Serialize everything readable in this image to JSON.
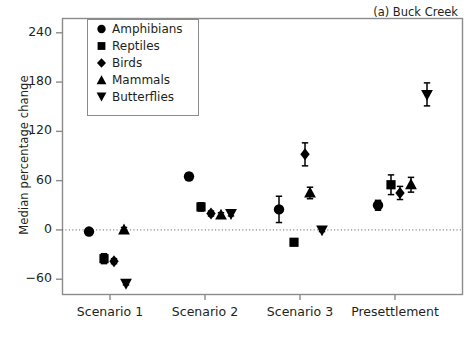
{
  "panel": {
    "title": "(a) Buck Creek"
  },
  "axes": {
    "ylabel": "Median percentage change",
    "xlabel": "",
    "yticks": [
      240,
      180,
      120,
      60,
      0,
      -60
    ],
    "ytick_labels": [
      "240",
      "180",
      "120",
      "60",
      "0",
      "−60"
    ],
    "ylim": [
      -78,
      258
    ],
    "xtick_labels": [
      "Scenario 1",
      "Scenario 2",
      "Scenario 3",
      "Presettlement"
    ],
    "zero_line": 0,
    "grid": false,
    "frame": true
  },
  "legend": {
    "position": "upper-left-inside",
    "entries": [
      {
        "label": "Amphibians",
        "marker": "circle",
        "color": "#000000"
      },
      {
        "label": "Reptiles",
        "marker": "square",
        "color": "#000000"
      },
      {
        "label": "Birds",
        "marker": "diamond",
        "color": "#000000"
      },
      {
        "label": "Mammals",
        "marker": "triangle-up",
        "color": "#000000"
      },
      {
        "label": "Butterflies",
        "marker": "triangle-down",
        "color": "#000000"
      }
    ]
  },
  "chart_data": {
    "type": "scatter",
    "title": "(a) Buck Creek",
    "xlabel": "",
    "ylabel": "Median percentage change",
    "ylim": [
      -78,
      258
    ],
    "categories": [
      "Scenario 1",
      "Scenario 2",
      "Scenario 3",
      "Presettlement"
    ],
    "series": [
      {
        "name": "Amphibians",
        "marker": "circle",
        "values": [
          -2,
          65,
          25,
          30
        ],
        "err_low": [
          3,
          4,
          16,
          6
        ],
        "err_high": [
          3,
          4,
          16,
          6
        ]
      },
      {
        "name": "Reptiles",
        "marker": "square",
        "values": [
          -35,
          28,
          -15,
          55
        ],
        "err_low": [
          6,
          5,
          4,
          12
        ],
        "err_high": [
          6,
          5,
          4,
          12
        ]
      },
      {
        "name": "Birds",
        "marker": "diamond",
        "values": [
          -38,
          20,
          92,
          45
        ],
        "err_low": [
          3,
          3,
          14,
          8
        ],
        "err_high": [
          3,
          3,
          14,
          8
        ]
      },
      {
        "name": "Mammals",
        "marker": "triangle-up",
        "values": [
          0,
          18,
          45,
          55
        ],
        "err_low": [
          3,
          3,
          7,
          9
        ],
        "err_high": [
          3,
          3,
          7,
          9
        ]
      },
      {
        "name": "Butterflies",
        "marker": "triangle-down",
        "values": [
          -65,
          20,
          0,
          165
        ],
        "err_low": [
          2,
          3,
          2,
          14
        ],
        "err_high": [
          2,
          3,
          2,
          14
        ]
      }
    ]
  }
}
